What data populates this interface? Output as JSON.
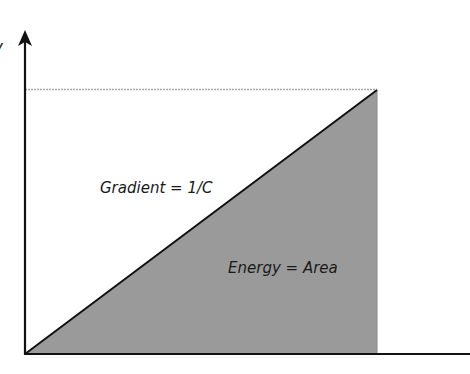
{
  "diagram": {
    "y_axis_label": "V",
    "gradient_label": "Gradient = 1/C",
    "area_label": "Energy = Area",
    "colors": {
      "axis": "#111111",
      "fill": "#9a9a9a",
      "guide_line": "#a8a8a8",
      "background": "#ffffff"
    },
    "geometry": {
      "origin": [
        25,
        354
      ],
      "vertex_top": [
        377,
        90
      ],
      "vertex_base": [
        377,
        354
      ]
    }
  }
}
